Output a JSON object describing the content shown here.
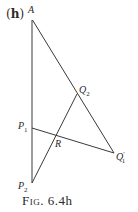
{
  "figure": {
    "panel_label": "h",
    "caption_prefix": "Fig.",
    "caption_number": "6.4h",
    "points": {
      "A": {
        "name": "A",
        "sub": "",
        "prime": ""
      },
      "Q2": {
        "name": "Q",
        "sub": "2",
        "prime": ""
      },
      "P1": {
        "name": "P",
        "sub": "1",
        "prime": ""
      },
      "R": {
        "name": "R",
        "sub": "",
        "prime": ""
      },
      "Q1p": {
        "name": "Q",
        "sub": "1",
        "prime": "′"
      },
      "P2": {
        "name": "P",
        "sub": "2",
        "prime": ""
      }
    },
    "line_color": "#3a3a3a"
  }
}
